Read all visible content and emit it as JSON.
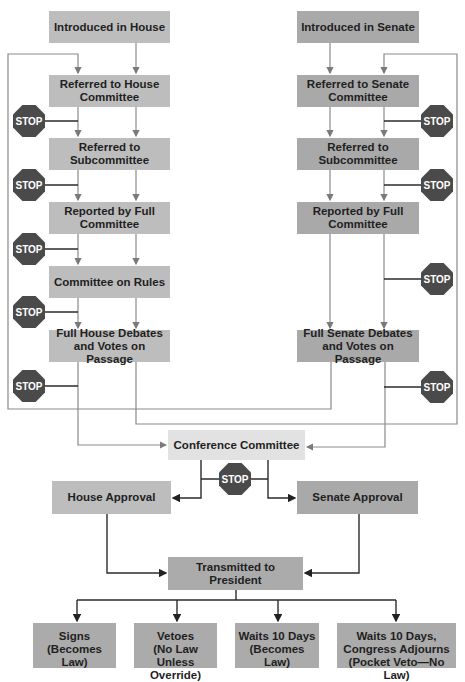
{
  "diagram": {
    "type": "flowchart",
    "title_fragment": "g",
    "house_column": [
      {
        "id": "house-introduced",
        "label": "Introduced in House"
      },
      {
        "id": "house-committee",
        "label": "Referred to House Committee"
      },
      {
        "id": "house-subcommittee",
        "label": "Referred to Subcommittee"
      },
      {
        "id": "house-reported",
        "label": "Reported by Full Committee"
      },
      {
        "id": "house-rules",
        "label": "Committee on Rules"
      },
      {
        "id": "house-debate",
        "label": "Full House Debates and Votes on Passage"
      }
    ],
    "senate_column": [
      {
        "id": "senate-introduced",
        "label": "Introduced in Senate"
      },
      {
        "id": "senate-committee",
        "label": "Referred to Senate Committee"
      },
      {
        "id": "senate-subcommittee",
        "label": "Referred to Subcommittee"
      },
      {
        "id": "senate-reported",
        "label": "Reported by Full Committee"
      },
      {
        "id": "senate-debate",
        "label": "Full Senate Debates and Votes on Passage"
      }
    ],
    "conference": {
      "label": "Conference Committee"
    },
    "approvals": {
      "house": {
        "label": "House Approval"
      },
      "senate": {
        "label": "Senate Approval"
      }
    },
    "president": {
      "label": "Transmitted to President"
    },
    "outcomes": [
      {
        "line1": "Signs",
        "line2": "(Becomes Law)",
        "line3": ""
      },
      {
        "line1": "Vetoes",
        "line2": "(No Law Unless",
        "line3": "Override)"
      },
      {
        "line1": "Waits 10 Days",
        "line2": "(Becomes Law)",
        "line3": ""
      },
      {
        "line1": "Waits 10 Days,",
        "line2": "Congress Adjourns",
        "line3": "(Pocket Veto—No Law)"
      }
    ],
    "stop_sign": {
      "label": "STOP",
      "color": "#4a4a4a",
      "text_color": "#ffffff"
    },
    "colors": {
      "house_box": "#bdbdbd",
      "senate_box": "#a9a9a9",
      "conference_box": "#e2e2e2",
      "line_gray": "#8a8a8a",
      "line_dark": "#2b2b2b"
    }
  }
}
